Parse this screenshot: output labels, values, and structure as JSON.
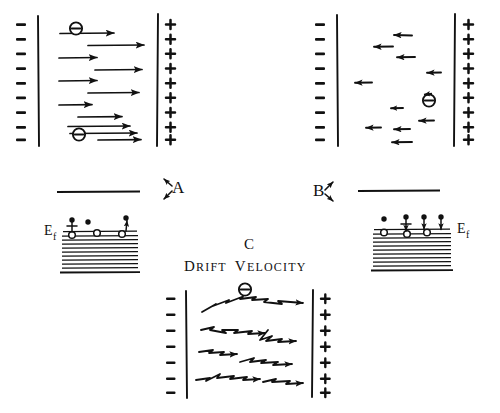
{
  "figure": {
    "title_text": "Drift velocity",
    "caption_letter": "C",
    "panels": [
      {
        "id": "A",
        "label": "A",
        "left_plate_sign": "−",
        "left_plate_count": 9,
        "right_plate_sign": "+",
        "right_plate_count": 9,
        "electron_glyph": "⊖",
        "electron_count": 2,
        "arrow_direction": "right",
        "arrow_count": 11,
        "description": "electrons drift right with long straight arrows"
      },
      {
        "id": "B",
        "label": "B",
        "left_plate_sign": "−",
        "left_plate_count": 9,
        "right_plate_sign": "+",
        "right_plate_count": 9,
        "electron_glyph": "⊖",
        "electron_count": 1,
        "arrow_direction": "left",
        "arrow_count": 10,
        "description": "short random leftward arrows scattered"
      },
      {
        "id": "C",
        "label": "C",
        "left_plate_sign": "−",
        "left_plate_count": 7,
        "right_plate_sign": "+",
        "right_plate_count": 7,
        "electron_glyph": "⊖",
        "electron_count": 1,
        "arrow_direction": "right-zigzag",
        "arrow_count": 6,
        "description": "zigzag scattering paths drifting right"
      }
    ],
    "band_diagrams": [
      {
        "id": "left-band",
        "fermi_label": "E",
        "fermi_subscript": "f",
        "fermi_label_side": "left",
        "excited_electron_dots": 3,
        "hole_circles": 3,
        "band_line_count": 11,
        "has_top_level_line": true,
        "arrow_note": "one electron with up arrow"
      },
      {
        "id": "right-band",
        "fermi_label": "E",
        "fermi_subscript": "f",
        "fermi_label_side": "right",
        "excited_electron_dots": 4,
        "hole_circles": 3,
        "band_line_count": 11,
        "has_top_level_line": true,
        "arrow_note": "two electrons with down arrows"
      }
    ],
    "corner_markers": [
      {
        "id": "A-arrows",
        "label": "A",
        "arrow_dirs": [
          "up-left",
          "down-left"
        ]
      },
      {
        "id": "B-arrows",
        "label": "B",
        "arrow_dirs": [
          "up-right",
          "down-right"
        ]
      }
    ],
    "colors": {
      "ink": "#111111",
      "background": "#ffffff"
    }
  }
}
